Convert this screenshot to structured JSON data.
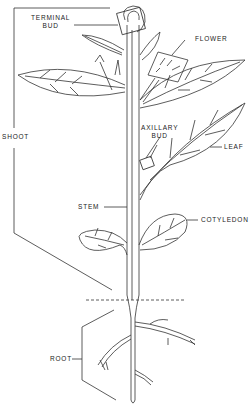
{
  "diagram": {
    "labels": {
      "terminal_bud_1": "TERMINAL",
      "terminal_bud_2": "BUD",
      "flower": "FLOWER",
      "shoot": "SHOOT",
      "axillary_bud_1": "AXILLARY",
      "axillary_bud_2": "BUD",
      "leaf": "LEAF",
      "stem": "STEM",
      "cotyledon": "COTYLEDON",
      "root": "ROOT"
    },
    "colors": {
      "line": "#333333",
      "background": "#ffffff"
    }
  }
}
